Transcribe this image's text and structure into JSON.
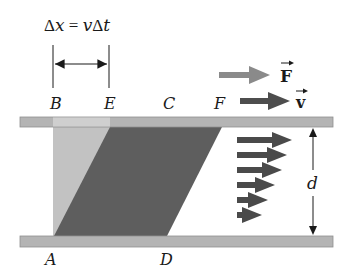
{
  "equation": {
    "delta1": "Δ",
    "x": "x",
    "equals": " = ",
    "v": "v",
    "delta2": "Δ",
    "t": "t"
  },
  "points": {
    "A": "A",
    "B": "B",
    "C": "C",
    "D": "D",
    "E": "E",
    "F": "F"
  },
  "vectors": {
    "force": "F",
    "velocity": "v"
  },
  "dimension": {
    "gap": "d"
  },
  "colors": {
    "plate": "#b4b4b4",
    "plate_edge": "#8f8f8f",
    "plate_light": "#cfcfcf",
    "initial_region": "#c2c2c2",
    "sheared_region": "#5e5e5e",
    "force_arrow": "#8a8a8a",
    "velocity_arrow": "#4d4d4d",
    "profile_arrow": "#4a4a4a",
    "text": "#1a1a1a"
  },
  "velocity_profile": {
    "arrow_count": 6,
    "tips_x": [
      292,
      287,
      282,
      275,
      268,
      262
    ],
    "y": [
      140,
      155,
      170,
      185,
      200,
      215
    ]
  }
}
